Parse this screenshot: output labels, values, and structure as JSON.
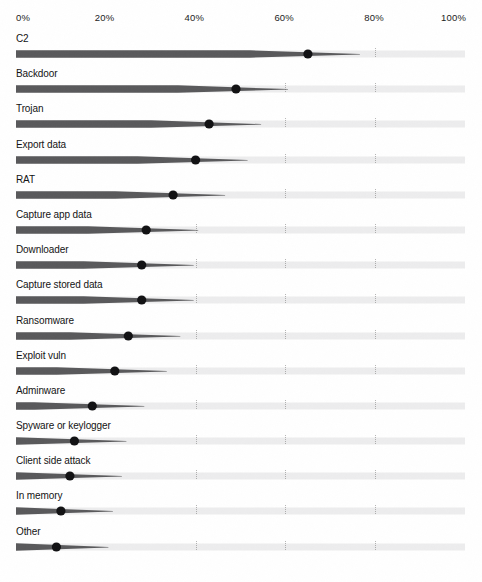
{
  "chart_data": {
    "type": "bar",
    "title": "",
    "subtitle": "",
    "xlabel": "",
    "ylabel": "",
    "xlim": [
      0,
      100
    ],
    "grid": true,
    "legend": null,
    "value_unit": "%",
    "axis_ticks": [
      {
        "label": "0%",
        "value": 0
      },
      {
        "label": "20%",
        "value": 20
      },
      {
        "label": "40%",
        "value": 40
      },
      {
        "label": "60%",
        "value": 60
      },
      {
        "label": "80%",
        "value": 80
      },
      {
        "label": "100%",
        "value": 100
      }
    ],
    "categories": [
      "C2",
      "Backdoor",
      "Trojan",
      "Export data",
      "RAT",
      "Capture app data",
      "Downloader",
      "Capture stored data",
      "Ransomware",
      "Exploit vuln",
      "Adminware",
      "Spyware or keylogger",
      "Client side attack",
      "In memory",
      "Other"
    ],
    "values": [
      65,
      49,
      43,
      40,
      35,
      29,
      28,
      28,
      25,
      22,
      17,
      13,
      12,
      10,
      9
    ],
    "series": [
      {
        "name": "Percent of malware samples",
        "values": [
          65,
          49,
          43,
          40,
          35,
          29,
          28,
          28,
          25,
          22,
          17,
          13,
          12,
          10,
          9
        ]
      }
    ],
    "marker": "dot",
    "colors": {
      "bar_fill": "#59595b",
      "bar_fill_dark": "#4a4a4c",
      "track": "#ededee",
      "marker": "#111113",
      "text": "#141414",
      "gridline": "#9a9a9a",
      "background": "#ffffff"
    }
  }
}
